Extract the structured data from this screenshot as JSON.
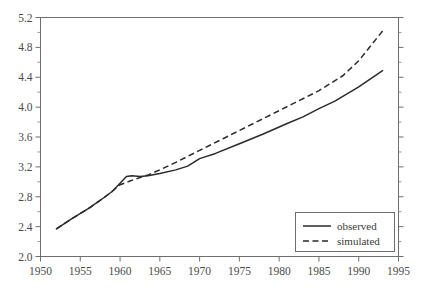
{
  "chart_data": {
    "type": "line",
    "title": "",
    "xlabel": "",
    "ylabel": "",
    "xlim": [
      1950,
      1995
    ],
    "ylim": [
      2.0,
      5.2
    ],
    "xticks": [
      1950,
      1955,
      1960,
      1965,
      1970,
      1975,
      1980,
      1985,
      1990,
      1995
    ],
    "yticks": [
      2.0,
      2.4,
      2.8,
      3.2,
      3.6,
      4.0,
      4.4,
      4.8,
      5.2
    ],
    "xtick_labels": [
      "1950",
      "1955",
      "1960",
      "1965",
      "1970",
      "1975",
      "1980",
      "1985",
      "1990",
      "1995"
    ],
    "ytick_labels": [
      "2.0",
      "2.4",
      "2.8",
      "3.2",
      "3.6",
      "4.0",
      "4.4",
      "4.8",
      "5.2"
    ],
    "minor_tick_step_y": 0.2,
    "grid": false,
    "legend_position": "bottom-right",
    "series": [
      {
        "name": "observed",
        "style": "solid",
        "color": "#2a2a2a",
        "x": [
          1952,
          1954,
          1956,
          1958,
          1959,
          1960,
          1960.8,
          1961.5,
          1962.5,
          1963.5,
          1965,
          1967,
          1968.5,
          1970,
          1972,
          1975,
          1978,
          1981,
          1983,
          1985,
          1987,
          1990,
          1993
        ],
        "y": [
          2.37,
          2.51,
          2.64,
          2.79,
          2.87,
          2.98,
          3.07,
          3.08,
          3.07,
          3.08,
          3.11,
          3.16,
          3.21,
          3.31,
          3.38,
          3.51,
          3.64,
          3.78,
          3.87,
          3.98,
          4.08,
          4.27,
          4.49
        ]
      },
      {
        "name": "simulated",
        "style": "dashed",
        "color": "#2a2a2a",
        "x": [
          1952,
          1954,
          1956,
          1958,
          1959,
          1960,
          1961,
          1962,
          1963.5,
          1965,
          1967,
          1970,
          1973,
          1976,
          1979,
          1982,
          1985,
          1988,
          1990,
          1993
        ],
        "y": [
          2.37,
          2.51,
          2.64,
          2.79,
          2.87,
          2.96,
          3.0,
          3.04,
          3.09,
          3.16,
          3.26,
          3.42,
          3.58,
          3.74,
          3.9,
          4.06,
          4.22,
          4.42,
          4.62,
          5.02
        ]
      }
    ],
    "legend_entries": [
      {
        "label": "observed",
        "style": "solid"
      },
      {
        "label": "simulated",
        "style": "dashed"
      }
    ]
  }
}
